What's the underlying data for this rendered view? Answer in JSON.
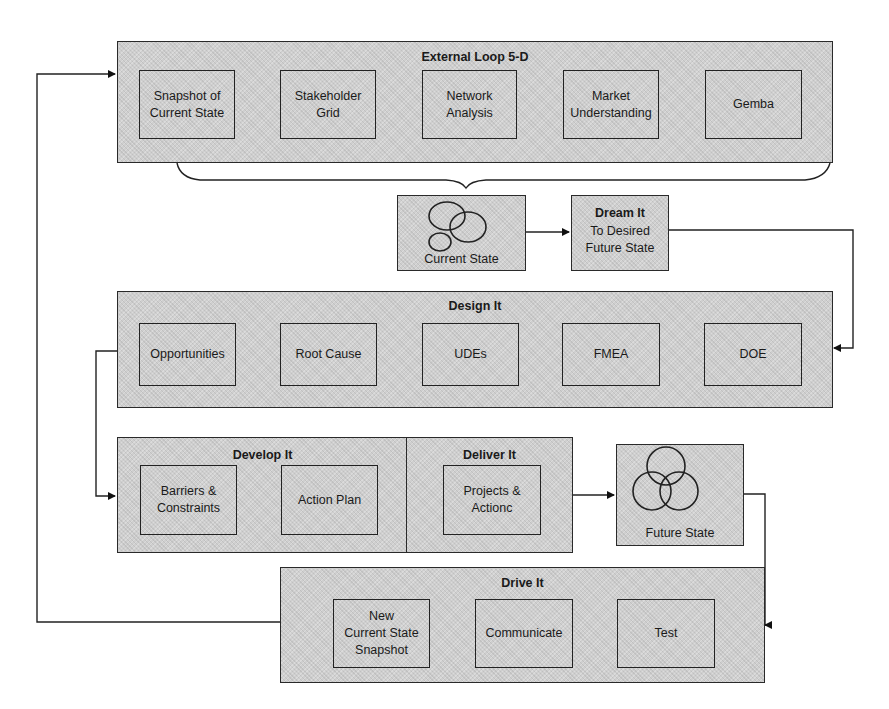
{
  "external_loop": {
    "title": "External Loop 5-D",
    "items": [
      {
        "label": "Snapshot of\nCurrent State"
      },
      {
        "label": "Stakeholder\nGrid"
      },
      {
        "label": "Network\nAnalysis"
      },
      {
        "label": "Market\nUnderstanding"
      },
      {
        "label": "Gemba"
      }
    ]
  },
  "current_state": {
    "label": "Current State",
    "icon": "overlapping-ellipses"
  },
  "dream_it": {
    "title": "Dream It",
    "subtitle": "To Desired\nFuture State"
  },
  "design_it": {
    "title": "Design It",
    "items": [
      {
        "label": "Opportunities"
      },
      {
        "label": "Root Cause"
      },
      {
        "label": "UDEs"
      },
      {
        "label": "FMEA"
      },
      {
        "label": "DOE"
      }
    ]
  },
  "develop_it": {
    "title": "Develop It",
    "items": [
      {
        "label": "Barriers &\nConstraints"
      },
      {
        "label": "Action Plan"
      }
    ]
  },
  "deliver_it": {
    "title": "Deliver It",
    "items": [
      {
        "label": "Projects &\nActionc"
      }
    ]
  },
  "future_state": {
    "label": "Future State",
    "icon": "venn-three-circles"
  },
  "drive_it": {
    "title": "Drive It",
    "items": [
      {
        "label": "New\nCurrent State\nSnapshot"
      },
      {
        "label": "Communicate"
      },
      {
        "label": "Test"
      }
    ]
  },
  "colors": {
    "fill": "#cfcfcf",
    "stroke": "#222222",
    "background": "#ffffff"
  }
}
